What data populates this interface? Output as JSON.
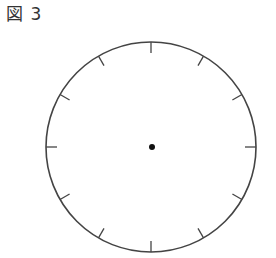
{
  "figure": {
    "label": "図 3"
  },
  "clock": {
    "center_x": 151,
    "center_y": 147,
    "radius": 105,
    "tick_count": 12,
    "tick_length": 11,
    "stroke_color": "#444444",
    "dot_color": "#111111",
    "dot_radius": 3
  }
}
